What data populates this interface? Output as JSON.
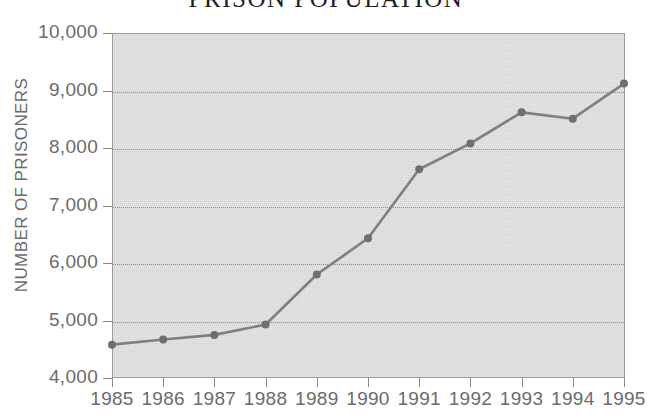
{
  "chart_data": {
    "type": "line",
    "title": "PRISON POPULATION",
    "xlabel": "",
    "ylabel": "NUMBER OF PRISONERS",
    "categories": [
      "1985",
      "1986",
      "1987",
      "1988",
      "1989",
      "1990",
      "1991",
      "1992",
      "1993",
      "1994",
      "1995"
    ],
    "values": [
      4580,
      4670,
      4750,
      4930,
      5800,
      6430,
      7630,
      8080,
      8620,
      8510,
      9120
    ],
    "series": [
      {
        "name": "Number of prisoners",
        "values": [
          4580,
          4670,
          4750,
          4930,
          5800,
          6430,
          7630,
          8080,
          8620,
          8510,
          9120
        ]
      }
    ],
    "ylim": [
      4000,
      10000
    ],
    "ytick_values": [
      4000,
      5000,
      6000,
      7000,
      8000,
      9000,
      10000
    ],
    "ytick_labels": [
      "4,000",
      "5,000",
      "6,000",
      "7,000",
      "8,000",
      "9,000",
      "10,000"
    ],
    "xtick_labels": [
      "1985",
      "1986",
      "1987",
      "1988",
      "1989",
      "1990",
      "1991",
      "1992",
      "1993",
      "1994",
      "1995"
    ],
    "grid": "horizontal-dotted",
    "legend": "none",
    "marker": "circle",
    "colors": {
      "plot_background": "#dcdcdc",
      "page_background": "#ffffff",
      "line": "#7f7f7f",
      "marker": "#6f6f6f",
      "gridline": "#8c8c8c",
      "axis": "#8a8a8a",
      "tick_text": "#6b6b6b",
      "title_text": "#1d1d1d"
    }
  }
}
